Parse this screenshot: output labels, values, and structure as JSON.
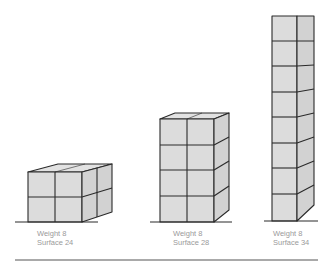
{
  "figure": {
    "colors": {
      "face": "#dcdcdc",
      "side": "#d2d2d2",
      "top": "#e2e2e2",
      "stroke": "#2a2a2a",
      "label": "#9a9a9a",
      "rule": "#555555"
    },
    "shapes": [
      {
        "name": "wide-block",
        "cubes_wide": 2,
        "cubes_high": 2,
        "cubes_deep": 2,
        "weight_label": "Weight 8",
        "surface_label": "Surface 24"
      },
      {
        "name": "medium-block",
        "cubes_wide": 2,
        "cubes_high": 4,
        "cubes_deep": 1,
        "weight_label": "Weight 8",
        "surface_label": "Surface 28"
      },
      {
        "name": "tall-column",
        "cubes_wide": 1,
        "cubes_high": 8,
        "cubes_deep": 1,
        "weight_label": "Weight 8",
        "surface_label": "Surface 34"
      }
    ]
  }
}
